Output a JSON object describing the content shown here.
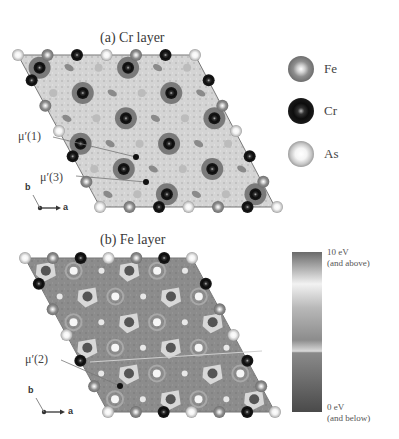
{
  "figure": {
    "panel_a": {
      "title": "(a) Cr layer",
      "annotations": [
        {
          "text": "μ′(1)",
          "label_x": 17,
          "label_y": 137,
          "target_x": 136,
          "target_y": 157
        },
        {
          "text": "μ′(3)",
          "label_x": 40,
          "label_y": 176,
          "target_x": 146,
          "target_y": 182
        }
      ],
      "axes": {
        "a": "a",
        "b": "b"
      }
    },
    "panel_b": {
      "title": "(b) Fe layer",
      "annotations": [
        {
          "text": "μ′(2)",
          "label_x": 25,
          "label_y": 360,
          "target_x": 120,
          "target_y": 386
        }
      ],
      "axes": {
        "a": "a",
        "b": "b"
      }
    },
    "legend": {
      "items": [
        {
          "label": "Fe",
          "color": "#8a8a8a"
        },
        {
          "label": "Cr",
          "color": "#111111"
        },
        {
          "label": "As",
          "color": "#c8c8c8"
        }
      ]
    },
    "colorbar": {
      "top_label": "10 eV",
      "top_sublabel": "(and above)",
      "bottom_label": "0 eV",
      "bottom_sublabel": "(and below)",
      "max_value": 10,
      "min_value": 0,
      "unit": "eV"
    }
  }
}
